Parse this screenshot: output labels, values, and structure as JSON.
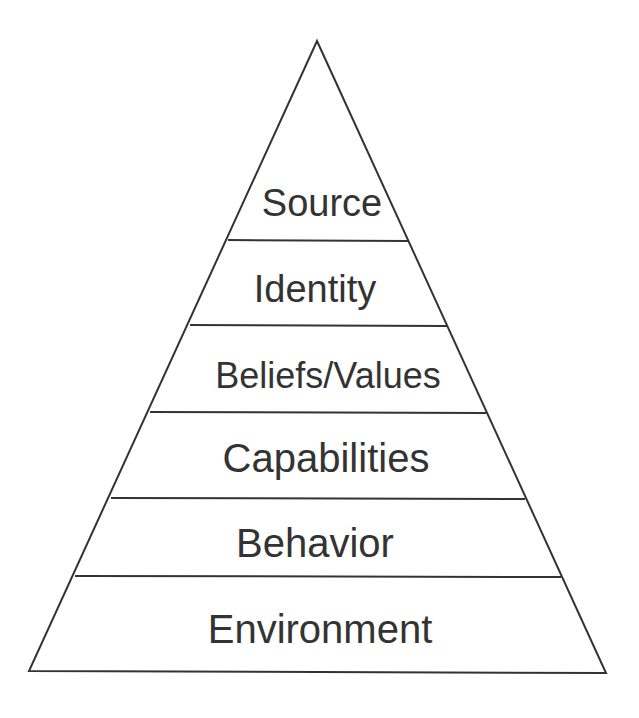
{
  "diagram": {
    "type": "pyramid",
    "colors": {
      "background": "#ffffff",
      "stroke": "#333333",
      "text": "#333333"
    },
    "levels": [
      {
        "label": "Source"
      },
      {
        "label": "Identity"
      },
      {
        "label": "Beliefs/Values"
      },
      {
        "label": "Capabilities"
      },
      {
        "label": "Behavior"
      },
      {
        "label": "Environment"
      }
    ]
  }
}
